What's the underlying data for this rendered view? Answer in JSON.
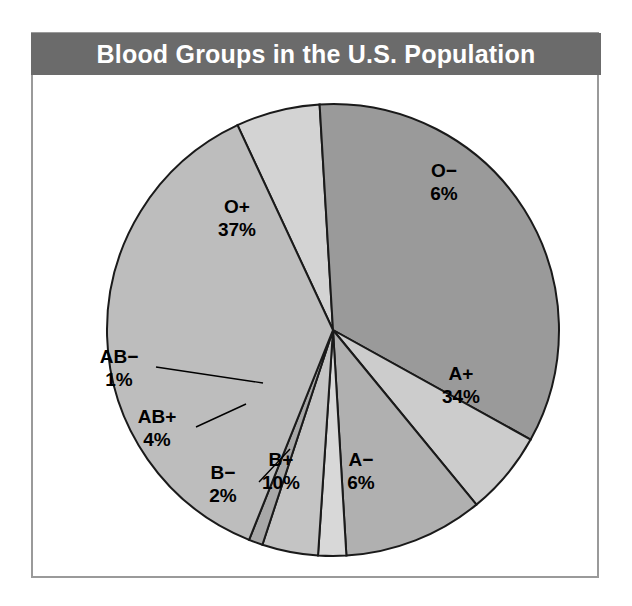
{
  "figure": {
    "title": "Blood Groups in the U.S. Population",
    "frame_color": "#9a9a9a",
    "banner_color": "#6b6b6b",
    "banner_text_color": "#ffffff",
    "background": "#ffffff"
  },
  "chart_data": {
    "type": "pie",
    "title": "Blood Groups in the U.S. Population",
    "xlabel": "",
    "ylabel": "",
    "unit": "%",
    "legend": "none",
    "grid": false,
    "start_angle_deg": -25,
    "direction": "clockwise",
    "categories": [
      "O−",
      "A+",
      "A−",
      "B+",
      "B−",
      "AB+",
      "AB−",
      "O+"
    ],
    "values": [
      6,
      34,
      6,
      10,
      2,
      4,
      1,
      37
    ],
    "slices": [
      {
        "label": "O−",
        "value": 6,
        "value_text": "6%",
        "color": "#d3d3d3",
        "label_placement": "inside"
      },
      {
        "label": "A+",
        "value": 34,
        "value_text": "34%",
        "color": "#9a9a9a",
        "label_placement": "inside"
      },
      {
        "label": "A−",
        "value": 6,
        "value_text": "6%",
        "color": "#cccccc",
        "label_placement": "inside"
      },
      {
        "label": "B+",
        "value": 10,
        "value_text": "10%",
        "color": "#b0b0b0",
        "label_placement": "inside"
      },
      {
        "label": "B−",
        "value": 2,
        "value_text": "2%",
        "color": "#d8d8d8",
        "label_placement": "outside"
      },
      {
        "label": "AB+",
        "value": 4,
        "value_text": "4%",
        "color": "#c4c4c4",
        "label_placement": "outside"
      },
      {
        "label": "AB−",
        "value": 1,
        "value_text": "1%",
        "color": "#a8a8a8",
        "label_placement": "outside"
      },
      {
        "label": "O+",
        "value": 37,
        "value_text": "37%",
        "color": "#bdbdbd",
        "label_placement": "inside"
      }
    ]
  },
  "labels": {
    "o_plus_name": "O+",
    "o_plus_pct": "37%",
    "o_minus_name": "O−",
    "o_minus_pct": "6%",
    "a_plus_name": "A+",
    "a_plus_pct": "34%",
    "a_minus_name": "A−",
    "a_minus_pct": "6%",
    "b_plus_name": "B+",
    "b_plus_pct": "10%",
    "b_minus_name": "B−",
    "b_minus_pct": "2%",
    "ab_plus_name": "AB+",
    "ab_plus_pct": "4%",
    "ab_minus_name": "AB−",
    "ab_minus_pct": "1%"
  }
}
